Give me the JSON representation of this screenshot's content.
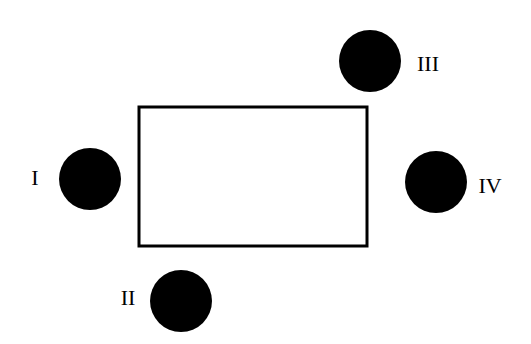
{
  "diagram": {
    "rectangle": {
      "x": 139,
      "y": 107,
      "w": 228,
      "h": 139,
      "stroke": "#000000"
    },
    "circles": [
      {
        "label": "I",
        "cx": 90,
        "cy": 179,
        "r": 31,
        "lx": 35,
        "ly": 178
      },
      {
        "label": "II",
        "cx": 181,
        "cy": 301,
        "r": 31,
        "lx": 128,
        "ly": 298
      },
      {
        "label": "III",
        "cx": 370,
        "cy": 61,
        "r": 31,
        "lx": 428,
        "ly": 64
      },
      {
        "label": "IV",
        "cx": 436,
        "cy": 182,
        "r": 31,
        "lx": 490,
        "ly": 186
      }
    ],
    "fill": "#000000"
  }
}
